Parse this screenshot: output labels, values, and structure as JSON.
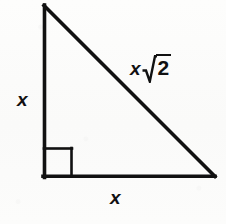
{
  "figure": {
    "name": "right-isosceles-triangle",
    "background_color": "#fcfcfb",
    "stroke_color": "#111111",
    "stroke_width": 3.5,
    "width": 226,
    "height": 224
  },
  "geometry": {
    "apex": {
      "x": 43,
      "y": 5
    },
    "bottom_left": {
      "x": 43,
      "y": 176
    },
    "bottom_right": {
      "x": 214,
      "y": 176
    },
    "right_angle_marker": {
      "name": "right-angle-square",
      "corner_x": 43,
      "corner_y": 176,
      "size": 28
    }
  },
  "labels": {
    "vertical_leg": "x",
    "horizontal_leg": "x",
    "hypotenuse": {
      "variable": "x",
      "radical_symbol": "√",
      "radicand": "2",
      "full_text": "x√2"
    }
  }
}
